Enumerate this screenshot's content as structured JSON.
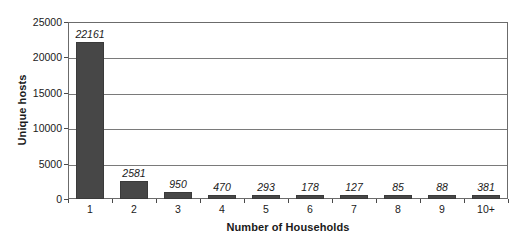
{
  "chart_data": {
    "type": "bar",
    "title": "",
    "xlabel": "Number of Households",
    "ylabel": "Unique hosts",
    "categories": [
      "1",
      "2",
      "3",
      "4",
      "5",
      "6",
      "7",
      "8",
      "9",
      "10+"
    ],
    "values": [
      22161,
      2581,
      950,
      470,
      293,
      178,
      127,
      85,
      88,
      381
    ],
    "value_labels": [
      "22161",
      "2581",
      "950",
      "470",
      "293",
      "178",
      "127",
      "85",
      "88",
      "381"
    ],
    "ylim": [
      0,
      25000
    ],
    "ytick_values": [
      0,
      5000,
      10000,
      15000,
      20000,
      25000
    ],
    "ytick_labels": [
      "0",
      "5000",
      "10000",
      "15000",
      "20000",
      "25000"
    ],
    "grid": "horizontal",
    "legend": "none",
    "series": [
      {
        "name": "Unique hosts",
        "color": "#474747",
        "values": [
          22161,
          2581,
          950,
          470,
          293,
          178,
          127,
          85,
          88,
          381
        ]
      }
    ],
    "colors": {
      "bar": "#474747",
      "bar_border": "#3a3a3a",
      "gridline": "#7a7a7a",
      "axis": "#6b6b6b",
      "text": "#1a1a1a",
      "background": "#ffffff"
    }
  }
}
